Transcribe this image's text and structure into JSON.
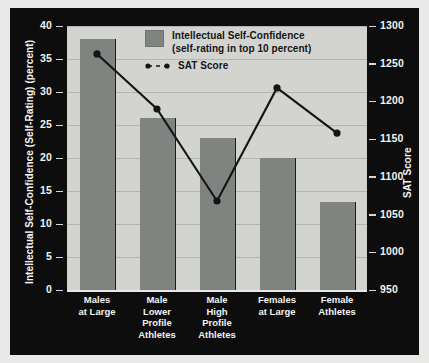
{
  "chart_data": {
    "type": "bar",
    "title": "",
    "categories": [
      "Males at Large",
      "Male Lower Profile Athletes",
      "Male High Profile Athletes",
      "Females at Large",
      "Female Athletes"
    ],
    "category_lines": [
      [
        "Males",
        "at Large"
      ],
      [
        "Male",
        "Lower",
        "Profile",
        "Athletes"
      ],
      [
        "Male",
        "High",
        "Profile",
        "Athletes"
      ],
      [
        "Females",
        "at Large"
      ],
      [
        "Female",
        "Athletes"
      ]
    ],
    "series": [
      {
        "name": "Intellectual Self-Confidence (self-rating in top 10 percent)",
        "type": "bar",
        "axis": "left",
        "values": [
          38,
          26,
          23,
          20,
          13.3
        ],
        "color": "#7f8480"
      },
      {
        "name": "SAT Score",
        "type": "line",
        "axis": "right",
        "values": [
          1263,
          1190,
          1068,
          1218,
          1158
        ],
        "color": "#141414"
      }
    ],
    "xlabel": "",
    "ylabel": "Intellectual Self-Confidence (Self-Rating) (percent)",
    "y2label": "SAT Score",
    "ylim": [
      0,
      40
    ],
    "y2lim": [
      950,
      1300
    ],
    "yticks": [
      0,
      5,
      10,
      15,
      20,
      25,
      30,
      35,
      40
    ],
    "y2ticks": [
      950,
      1000,
      1050,
      1100,
      1150,
      1200,
      1250,
      1300
    ],
    "grid": true,
    "legend_position": "top-center"
  },
  "axes": {
    "left_title": "Intellectual Self-Confidence (Self-Rating) (percent)",
    "right_title": "SAT Score",
    "left_ticks": [
      "40",
      "35",
      "30",
      "25",
      "20",
      "15",
      "10",
      "5",
      "0"
    ],
    "right_ticks": [
      "1300",
      "1250",
      "1200",
      "1150",
      "1100",
      "1050",
      "1000",
      "950"
    ]
  },
  "legend": {
    "bar_label_line1": "Intellectual Self-Confidence",
    "bar_label_line2": "(self-rating in top 10 percent)",
    "line_label": "SAT Score",
    "bar_color": "#7f8480",
    "line_color": "#141414"
  },
  "colors": {
    "panel_background": "#0d0d0d",
    "plot_background": "#d3d4d0",
    "gridline": "#b4b5b1",
    "page_background": "#e9e9e7",
    "tick_text": "#f2f2f2"
  }
}
